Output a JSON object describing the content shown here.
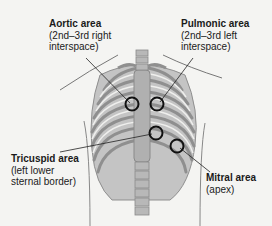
{
  "diagram": {
    "type": "anatomical-illustration",
    "areas": [
      {
        "id": "aortic",
        "title": "Aortic area",
        "desc_line1": "(2nd–3rd right",
        "desc_line2": "interspace)"
      },
      {
        "id": "pulmonic",
        "title": "Pulmonic area",
        "desc_line1": "(2nd–3rd left",
        "desc_line2": "interspace)"
      },
      {
        "id": "tricuspid",
        "title": "Tricuspid area",
        "desc_line1": "(left lower",
        "desc_line2": "sternal border)"
      },
      {
        "id": "mitral",
        "title": "Mitral area",
        "desc_line1": "(apex)",
        "desc_line2": ""
      }
    ],
    "colors": {
      "background": "#f4f4f2",
      "bone": "#b8b8b8",
      "bone_dark": "#8f8f8f",
      "marker": "#111111",
      "outline": "#777777"
    }
  }
}
